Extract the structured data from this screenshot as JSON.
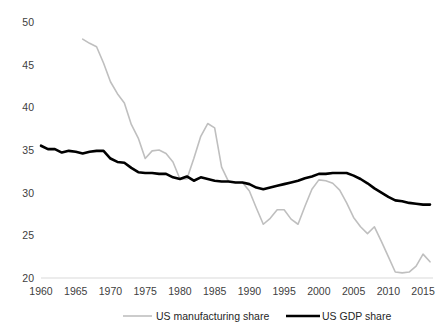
{
  "chart_data": {
    "type": "line",
    "title": "",
    "subtitle": "",
    "xlabel": "",
    "ylabel": "",
    "xlim": [
      1960,
      2016
    ],
    "ylim": [
      20,
      50
    ],
    "xticks": [
      1960,
      1965,
      1970,
      1975,
      1980,
      1985,
      1990,
      1995,
      2000,
      2005,
      2010,
      2015
    ],
    "yticks": [
      20,
      25,
      30,
      35,
      40,
      45,
      50
    ],
    "grid": false,
    "legend_position": "bottom",
    "axis_color": "#d9d9d9",
    "series": [
      {
        "name": "US manufacturing share",
        "color": "#bfbfbf",
        "width": 1.6,
        "x": [
          1966,
          1967,
          1968,
          1969,
          1970,
          1971,
          1972,
          1973,
          1974,
          1975,
          1976,
          1977,
          1978,
          1979,
          1980,
          1981,
          1982,
          1983,
          1984,
          1985,
          1986,
          1987,
          1988,
          1989,
          1990,
          1991,
          1992,
          1993,
          1994,
          1995,
          1996,
          1997,
          1998,
          1999,
          2000,
          2001,
          2002,
          2003,
          2004,
          2005,
          2006,
          2007,
          2008,
          2009,
          2010,
          2011,
          2012,
          2013,
          2014,
          2015,
          2016
        ],
        "values": [
          48.0,
          47.5,
          47.1,
          45.2,
          43.0,
          41.6,
          40.5,
          38.0,
          36.4,
          34.0,
          34.9,
          35.0,
          34.6,
          33.6,
          31.6,
          31.6,
          34.0,
          36.6,
          38.1,
          37.6,
          33.0,
          31.3,
          31.2,
          31.2,
          30.2,
          28.2,
          26.3,
          27.0,
          28.0,
          28.0,
          26.9,
          26.3,
          28.4,
          30.4,
          31.5,
          31.4,
          31.1,
          30.3,
          28.8,
          27.1,
          26.0,
          25.2,
          26.0,
          24.3,
          22.5,
          20.7,
          20.6,
          20.7,
          21.4,
          22.8,
          21.9
        ]
      },
      {
        "name": "US GDP share",
        "color": "#000000",
        "width": 2.6,
        "x": [
          1960,
          1961,
          1962,
          1963,
          1964,
          1965,
          1966,
          1967,
          1968,
          1969,
          1970,
          1971,
          1972,
          1973,
          1974,
          1975,
          1976,
          1977,
          1978,
          1979,
          1980,
          1981,
          1982,
          1983,
          1984,
          1985,
          1986,
          1987,
          1988,
          1989,
          1990,
          1991,
          1992,
          1993,
          1994,
          1995,
          1996,
          1997,
          1998,
          1999,
          2000,
          2001,
          2002,
          2003,
          2004,
          2005,
          2006,
          2007,
          2008,
          2009,
          2010,
          2011,
          2012,
          2013,
          2014,
          2015,
          2016
        ],
        "values": [
          35.5,
          35.1,
          35.1,
          34.7,
          34.9,
          34.8,
          34.6,
          34.8,
          34.9,
          34.9,
          34.0,
          33.6,
          33.5,
          32.9,
          32.4,
          32.3,
          32.3,
          32.2,
          32.2,
          31.8,
          31.6,
          31.9,
          31.4,
          31.8,
          31.6,
          31.4,
          31.3,
          31.3,
          31.2,
          31.2,
          31.0,
          30.6,
          30.4,
          30.6,
          30.8,
          31.0,
          31.2,
          31.4,
          31.7,
          31.9,
          32.2,
          32.2,
          32.3,
          32.3,
          32.3,
          32.0,
          31.6,
          31.1,
          30.5,
          30.0,
          29.5,
          29.1,
          29.0,
          28.8,
          28.7,
          28.6,
          28.6
        ]
      }
    ]
  },
  "legend": {
    "items": [
      {
        "label": "US manufacturing share",
        "color": "#bfbfbf"
      },
      {
        "label": "US GDP share",
        "color": "#000000"
      }
    ]
  }
}
